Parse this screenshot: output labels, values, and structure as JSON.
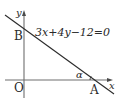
{
  "diagram": {
    "equation": "3x+4y−12=0",
    "axes": {
      "x_label": "x",
      "y_label": "y"
    },
    "points": {
      "origin": "O",
      "a": "A",
      "b": "B"
    },
    "angle_label": "α",
    "colors": {
      "axis": "#6e6e6e",
      "line": "#2a2a2a",
      "text": "#2a2a2a"
    }
  }
}
